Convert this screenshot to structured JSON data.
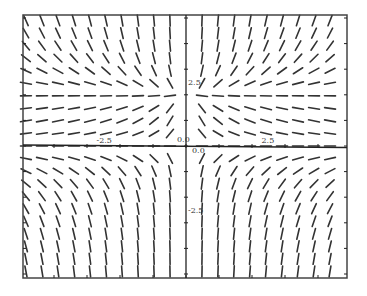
{
  "chart_data": {
    "type": "slope_field",
    "title": "",
    "xlabel": "",
    "ylabel": "",
    "equation_estimate": "dy/dx = y(y-2)/x",
    "xlim": [
      -5,
      5
    ],
    "ylim": [
      -5,
      5
    ],
    "grid": false,
    "legend": null,
    "x_tick_labels": [
      {
        "value": -2.5,
        "label": "-2.5"
      },
      {
        "value": 0,
        "label": "0.0"
      },
      {
        "value": 2.5,
        "label": "2.5"
      }
    ],
    "y_tick_labels": [
      {
        "value": 2.5,
        "label": "2.5"
      },
      {
        "value": 0,
        "label": "0.0"
      },
      {
        "value": -2.5,
        "label": "-2.5"
      }
    ],
    "equilibrium_lines": [
      0,
      2
    ],
    "field_grid": {
      "x_start": -4.85,
      "x_step": 0.485,
      "x_count": 21,
      "y_start": -4.9,
      "y_step": 0.49,
      "y_count": 21,
      "segment_length_px": 11
    },
    "quadrant_slope_signs": {
      "x_neg_y_above_2": "negative",
      "x_neg_y_between_0_2": "positive",
      "x_neg_y_below_0": "negative",
      "x_pos_y_above_2": "positive",
      "x_pos_y_between_0_2": "negative",
      "x_pos_y_below_0": "positive"
    }
  },
  "layout": {
    "frame": {
      "left": 23,
      "top": 15,
      "right": 347,
      "bottom": 278
    },
    "origin_px": {
      "x": 186,
      "y": 146
    },
    "px_per_unit_x": 33,
    "px_per_unit_y": 25.6
  },
  "colors": {
    "segment": "#333333",
    "axis": "#222222",
    "frame": "#444444",
    "background": "#ffffff"
  }
}
